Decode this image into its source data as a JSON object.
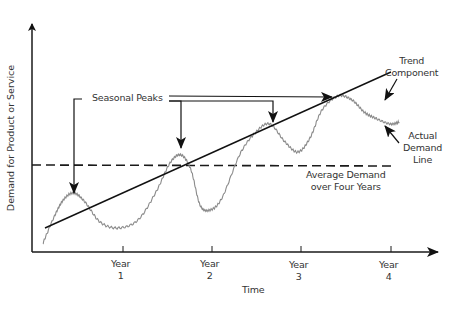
{
  "chart_data": {
    "type": "line",
    "title": "",
    "xlabel": "Time",
    "ylabel": "Demand for Product or Service",
    "x_ticks": [
      "Year 1",
      "Year 2",
      "Year 3",
      "Year 4"
    ],
    "grid": false,
    "legend": "none (inline annotations)",
    "series": [
      {
        "name": "Actual Demand Line",
        "style": "wavy gray",
        "description": "seasonal oscillation around rising trend with four peaks"
      },
      {
        "name": "Trend Component",
        "style": "solid black straight line",
        "start_y_rel": 0.1,
        "end_y_rel": 0.78
      },
      {
        "name": "Average Demand over Four Years",
        "style": "dashed black horizontal line",
        "y_rel": 0.38
      }
    ],
    "annotations": [
      "Seasonal Peaks",
      "Trend Component",
      "Actual Demand Line",
      "Average Demand over Four Years"
    ]
  },
  "labels": {
    "y_axis": "Demand for Product or Service",
    "x_axis": "Time",
    "seasonal_peaks": "Seasonal Peaks",
    "trend_line1": "Trend",
    "trend_line2": "Component",
    "actual_line1": "Actual",
    "actual_line2": "Demand",
    "actual_line3": "Line",
    "average_line1": "Average Demand",
    "average_line2": "over Four Years",
    "ticks": [
      {
        "word": "Year",
        "num": "1"
      },
      {
        "word": "Year",
        "num": "2"
      },
      {
        "word": "Year",
        "num": "3"
      },
      {
        "word": "Year",
        "num": "4"
      }
    ]
  },
  "colors": {
    "axis": "#1a1a1a",
    "actual_demand": "#8a8a8a",
    "text": "#333333"
  }
}
